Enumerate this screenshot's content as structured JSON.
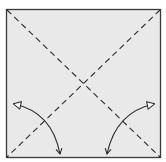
{
  "diagram": {
    "type": "origami-fold-step",
    "paper": {
      "shape": "square",
      "fill": "#e9e9e9",
      "stroke": "#3a3a3a",
      "x": 6,
      "y": 9,
      "width": 155,
      "height": 149
    },
    "creases": [
      {
        "name": "valley-fold-diagonal-tl-br",
        "style": "dashed",
        "from": [
          7,
          10
        ],
        "to": [
          160,
          157
        ]
      },
      {
        "name": "valley-fold-diagonal-tr-bl",
        "style": "dashed",
        "from": [
          160,
          10
        ],
        "to": [
          7,
          157
        ]
      }
    ],
    "arrows": [
      {
        "name": "fold-and-unfold-arrow-left",
        "from": [
          60,
          155
        ],
        "to": [
          12,
          103
        ],
        "bend": "outward"
      },
      {
        "name": "fold-and-unfold-arrow-right",
        "from": [
          107,
          155
        ],
        "to": [
          156,
          103
        ],
        "bend": "outward"
      }
    ],
    "colors": {
      "line": "#2a2a2a",
      "paper": "#e9e9e9",
      "background": "#ffffff"
    }
  }
}
